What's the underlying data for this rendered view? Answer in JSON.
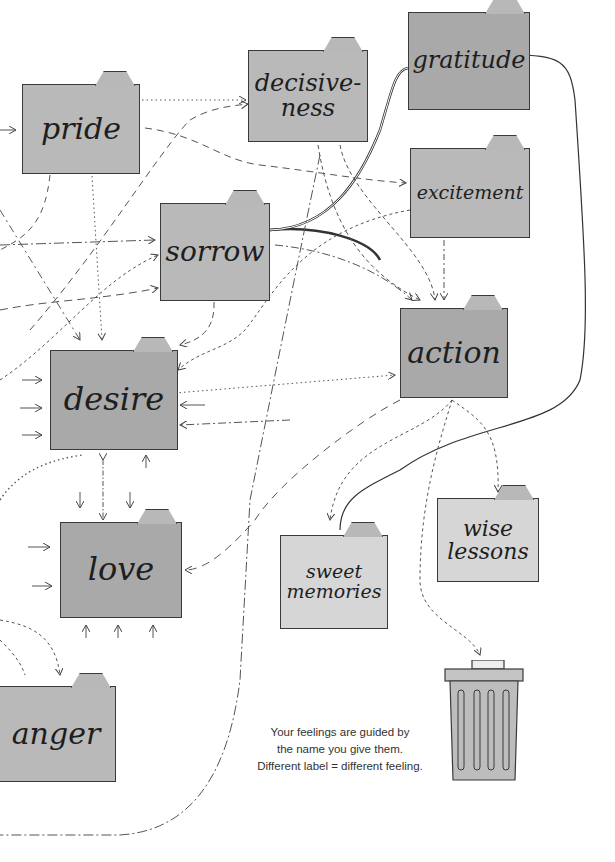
{
  "folders": {
    "pride": "pride",
    "decisiveness": "decisive-\nness",
    "gratitude": "gratitude",
    "excitement": "excitement",
    "sorrow": "sorrow",
    "action": "action",
    "desire": "desire",
    "love": "love",
    "wise_lessons": "wise\nlessons",
    "sweet_memories": "sweet\nmemories",
    "anger": "anger"
  },
  "trash": {
    "icon": "trash-can-icon"
  },
  "caption": {
    "line1": "Your feelings are guided by",
    "line2": "the name you give them.",
    "line3": "Different label = different feeling."
  },
  "colors": {
    "folder_dark": "#a9a9a9",
    "folder_light": "#d6d6d6",
    "ink": "#3a3a3a"
  }
}
